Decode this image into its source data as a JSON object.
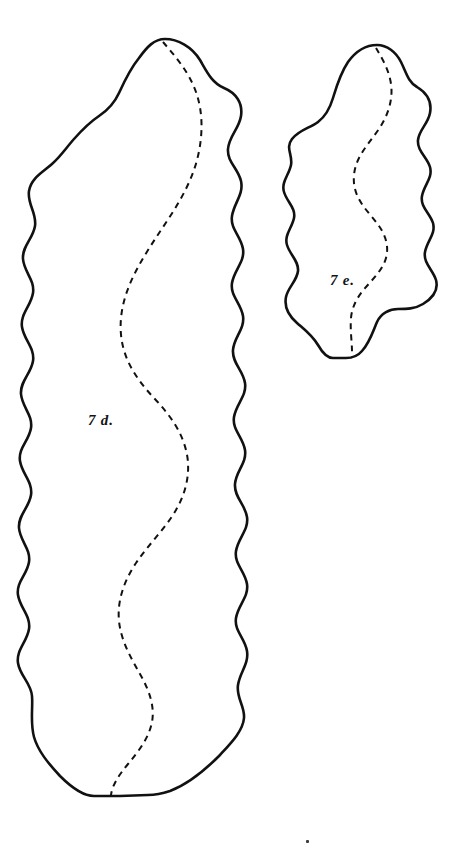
{
  "plate": {
    "background_color": "#ffffff",
    "ink_color": "#111111",
    "width": 469,
    "height": 854,
    "title": "Plate of two outlined specimen figures",
    "description": "Two scalloped, wavy-edged outline figures drawn in black ink on white, each bisected by a dashed curving line; hand-lettered italic figure labels."
  },
  "figures": [
    {
      "id": "fig-7d",
      "label": "7 d.",
      "label_x": 88,
      "label_y": 412,
      "outline_name": "large-scalloped-outline",
      "midrib_name": "dashed-midline",
      "stroke_color": "#111111",
      "fill_color": "#ffffff",
      "stroke_width": 2.6,
      "dash_pattern": "6 5",
      "bounds": {
        "x": 18,
        "y": 38,
        "width": 236,
        "height": 762
      }
    },
    {
      "id": "fig-7e",
      "label": "7 e.",
      "label_x": 330,
      "label_y": 272,
      "outline_name": "small-scalloped-outline",
      "midrib_name": "dashed-midline",
      "stroke_color": "#111111",
      "fill_color": "#ffffff",
      "stroke_width": 2.6,
      "dash_pattern": "6 5",
      "bounds": {
        "x": 291,
        "y": 44,
        "width": 154,
        "height": 316
      }
    }
  ],
  "marks": [
    {
      "name": "ink-speck",
      "x": 306,
      "y": 840
    }
  ]
}
